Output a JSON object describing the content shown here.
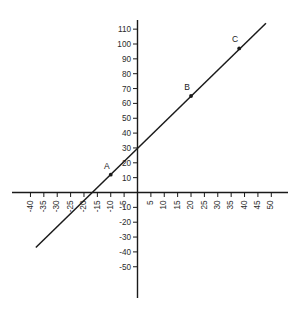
{
  "chart_data": {
    "type": "line",
    "title": "",
    "xlabel": "",
    "ylabel": "",
    "xlim": [
      -42,
      52
    ],
    "ylim": [
      -56,
      116
    ],
    "grid": false,
    "legend": "none",
    "x_ticks": [
      -40,
      -35,
      -30,
      -25,
      -20,
      -15,
      -10,
      -5,
      5,
      10,
      15,
      20,
      25,
      30,
      35,
      40,
      45,
      50
    ],
    "x_tick_labels": [
      "-40",
      "-35",
      "-30",
      "-25",
      "-20",
      "-15",
      "-10",
      "-5",
      "5",
      "10",
      "15",
      "20",
      "25",
      "30",
      "35",
      "40",
      "45",
      "50"
    ],
    "y_ticks": [
      -50,
      -40,
      -30,
      -20,
      -10,
      10,
      20,
      30,
      40,
      50,
      60,
      70,
      80,
      90,
      100,
      110
    ],
    "y_tick_labels": [
      "-50",
      "-40",
      "-30",
      "-20",
      "-10",
      "10",
      "20",
      "30",
      "40",
      "50",
      "60",
      "70",
      "80",
      "90",
      "100",
      "110"
    ],
    "series": [
      {
        "name": "line",
        "x": [
          -38,
          48
        ],
        "y": [
          -37,
          114
        ],
        "slope": 1.76,
        "intercept": 30,
        "x_intercept": -17
      }
    ],
    "points": [
      {
        "label": "A",
        "x": -10,
        "y": 12
      },
      {
        "label": "B",
        "x": 20,
        "y": 65
      },
      {
        "label": "C",
        "x": 38,
        "y": 97
      }
    ],
    "axis_color": "#1a1a1a",
    "line_color": "#1a1a1a"
  },
  "caption": {
    "text": ""
  }
}
